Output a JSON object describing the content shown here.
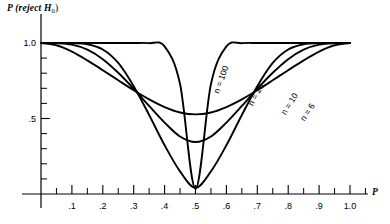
{
  "figure": {
    "y_axis_title": "P (reject H",
    "y_axis_title_sub": "0",
    "y_axis_title_tail": ")",
    "x_axis_name": "P"
  },
  "chart_data": {
    "type": "line",
    "title": "P (reject H0)",
    "xlabel": "P",
    "ylabel": "P (reject H0)",
    "xlim": [
      0,
      1.08
    ],
    "ylim": [
      0,
      1.06
    ],
    "grid": false,
    "legend": "inline-curve-labels",
    "x_ticks_major": [
      0.1,
      0.2,
      0.3,
      0.4,
      0.5,
      0.6,
      0.7,
      0.8,
      0.9,
      1.0
    ],
    "x_tick_labels": [
      ".1",
      ".2",
      ".3",
      ".4",
      ".5",
      ".6",
      ".7",
      ".8",
      ".9",
      "1.0"
    ],
    "x_ticks_minor": [
      0.05,
      0.15,
      0.25,
      0.35,
      0.45,
      0.55,
      0.65,
      0.75,
      0.85,
      0.95,
      1.05
    ],
    "y_ticks_major": [
      0.5,
      1.0
    ],
    "y_tick_labels": [
      ".5",
      "1.0"
    ],
    "y_ticks_minor": [
      0.1,
      0.2,
      0.3,
      0.4,
      0.6,
      0.7,
      0.8,
      0.9
    ],
    "x": [
      0.0,
      0.05,
      0.1,
      0.15,
      0.2,
      0.25,
      0.3,
      0.35,
      0.4,
      0.45,
      0.5,
      0.55,
      0.6,
      0.65,
      0.7,
      0.75,
      0.8,
      0.85,
      0.9,
      0.95,
      1.0
    ],
    "series": [
      {
        "name": "n = 100",
        "label": "n = 100",
        "label_x": 0.565,
        "label_y": 0.705,
        "label_angle": -70,
        "values": [
          1.0,
          1.0,
          1.0,
          1.0,
          1.0,
          1.0,
          1.0,
          0.999,
          0.978,
          0.728,
          0.035,
          0.728,
          0.978,
          0.999,
          1.0,
          1.0,
          1.0,
          1.0,
          1.0,
          1.0,
          1.0
        ]
      },
      {
        "name": "n = 20",
        "label": "n = 20",
        "label_x": 0.676,
        "label_y": 0.625,
        "label_angle": -62,
        "values": [
          1.0,
          1.0,
          0.999,
          0.992,
          0.957,
          0.868,
          0.714,
          0.523,
          0.323,
          0.15,
          0.041,
          0.15,
          0.323,
          0.523,
          0.714,
          0.868,
          0.957,
          0.992,
          0.999,
          1.0,
          1.0
        ]
      },
      {
        "name": "n = 10",
        "label": "n = 10",
        "label_x": 0.782,
        "label_y": 0.56,
        "label_angle": -58,
        "values": [
          1.0,
          0.999,
          0.989,
          0.956,
          0.893,
          0.803,
          0.697,
          0.583,
          0.473,
          0.381,
          0.344,
          0.381,
          0.473,
          0.583,
          0.697,
          0.803,
          0.893,
          0.956,
          0.989,
          0.999,
          1.0
        ]
      },
      {
        "name": "n = 6",
        "label": "n = 6",
        "label_x": 0.846,
        "label_y": 0.52,
        "label_angle": -56,
        "values": [
          1.0,
          0.985,
          0.943,
          0.885,
          0.82,
          0.753,
          0.687,
          0.627,
          0.576,
          0.54,
          0.527,
          0.54,
          0.576,
          0.627,
          0.687,
          0.753,
          0.82,
          0.885,
          0.943,
          0.985,
          1.0
        ]
      }
    ]
  }
}
